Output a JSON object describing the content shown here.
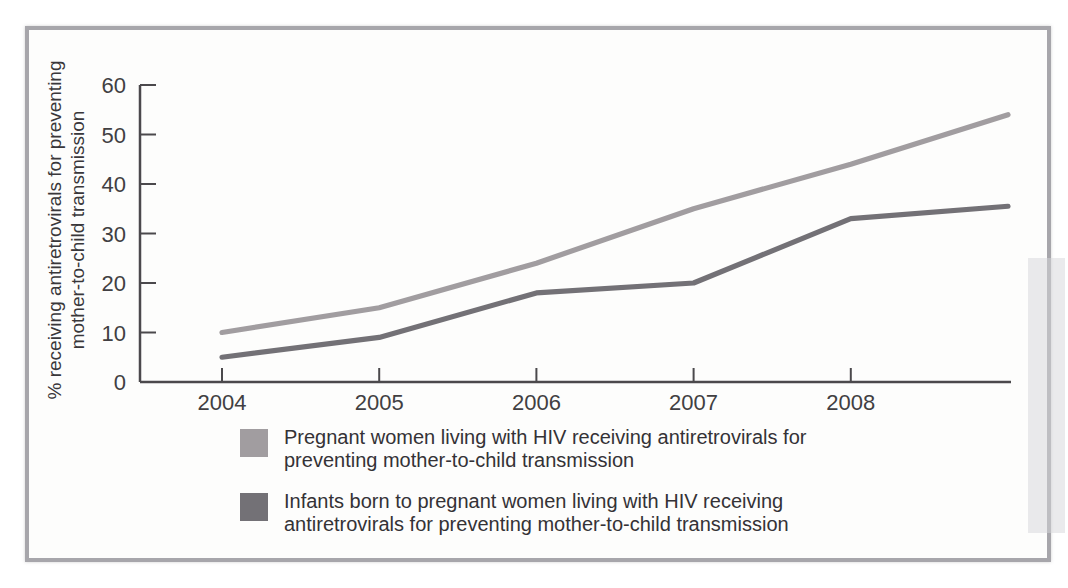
{
  "chart_data": {
    "type": "line",
    "x": [
      2004,
      2005,
      2006,
      2007,
      2008,
      2009
    ],
    "x_tick_labels": [
      "2004",
      "2005",
      "2006",
      "2007",
      "2008"
    ],
    "y_ticks": [
      0,
      10,
      20,
      30,
      40,
      50,
      60
    ],
    "ylim": [
      0,
      60
    ],
    "xlabel": "",
    "ylabel": "% receiving antiretrovirals for preventing mother-to-child transmission",
    "ylabel_lines": [
      "% receiving antiretrovirals for preventing",
      "mother-to-child transmission"
    ],
    "grid": false,
    "legend_position": "bottom",
    "series": [
      {
        "name": "Pregnant women living with HIV receiving antiretrovirals for preventing mother-to-child transmission",
        "label_lines": [
          "Pregnant women living with HIV receiving antiretrovirals for",
          "preventing mother-to-child transmission"
        ],
        "color": "#a19da0",
        "values": [
          10,
          15,
          24,
          35,
          44,
          54
        ]
      },
      {
        "name": "Infants born to pregnant women living with HIV receiving antiretrovirals for preventing mother-to-child transmission",
        "label_lines": [
          "Infants born to pregnant women living with HIV receiving",
          "antiretrovirals for preventing mother-to-child transmission"
        ],
        "color": "#737176",
        "values": [
          5,
          9,
          18,
          20,
          33,
          35.5
        ]
      }
    ]
  },
  "palette": {
    "frame_border": "#a7a6ab",
    "axis": "#4b494c",
    "tick_text": "#413f42",
    "background": "#fdfdfc"
  }
}
